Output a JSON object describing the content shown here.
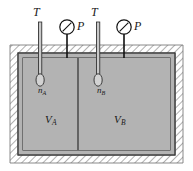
{
  "figure": {
    "type": "thermodynamics-schematic",
    "width": 193,
    "height": 171,
    "colors": {
      "background": "#ffffff",
      "wall_hatch_line": "#6d6d6d",
      "wall_fill": "#ffffff",
      "gas_fill": "#b3b3b3",
      "outline": "#333333",
      "instrument_line": "#111111",
      "thermometer_fill": "#c9c9c9",
      "label_color": "#1a1a1a"
    }
  },
  "labels": {
    "temperature_left": "T",
    "temperature_right": "T",
    "pressure_left": "P",
    "pressure_right": "P",
    "moles_left_main": "n",
    "moles_left_sub": "A",
    "moles_right_main": "n",
    "moles_right_sub": "B",
    "volume_left_main": "V",
    "volume_left_sub": "A",
    "volume_right_main": "V",
    "volume_right_sub": "B"
  },
  "instruments": [
    {
      "id": "thermometer-left",
      "kind": "thermometer",
      "label": "T",
      "chamber": "A"
    },
    {
      "id": "gauge-left",
      "kind": "pressure-gauge",
      "label": "P",
      "chamber": "A"
    },
    {
      "id": "thermometer-right",
      "kind": "thermometer",
      "label": "T",
      "chamber": "B"
    },
    {
      "id": "gauge-right",
      "kind": "pressure-gauge",
      "label": "P",
      "chamber": "B"
    }
  ],
  "chambers": [
    {
      "id": "chamber-a",
      "name": "A",
      "moles": "n_A",
      "volume": "V_A"
    },
    {
      "id": "chamber-b",
      "name": "B",
      "moles": "n_B",
      "volume": "V_B"
    }
  ]
}
